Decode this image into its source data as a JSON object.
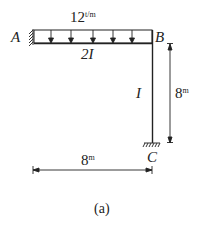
{
  "diagram": {
    "load": {
      "value": "12",
      "unit": "t/m"
    },
    "nodes": {
      "A": "A",
      "B": "B",
      "C": "C"
    },
    "beam_stiffness": "2I",
    "column_stiffness": "I",
    "height_dim": {
      "value": "8",
      "unit": "m"
    },
    "span_dim": {
      "value": "8",
      "unit": "m"
    },
    "caption": "(a)"
  }
}
